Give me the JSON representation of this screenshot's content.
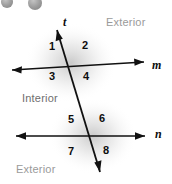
{
  "figure": {
    "type": "geometry-diagram",
    "background_color": "#ffffff",
    "shading_color": "#bdbdbd",
    "stroke_color": "#111111"
  },
  "lines": [
    {
      "id": "transversal",
      "label": "t",
      "label_x": 63,
      "label_y": 16,
      "x1": 57,
      "y1": 30,
      "x2": 100,
      "y2": 172,
      "arrow_start": true,
      "arrow_end": true
    },
    {
      "id": "line-m",
      "label": "m",
      "label_x": 152,
      "label_y": 59,
      "x1": 12,
      "y1": 70,
      "x2": 144,
      "y2": 62,
      "arrow_start": true,
      "arrow_end": true
    },
    {
      "id": "line-n",
      "label": "n",
      "label_x": 155,
      "label_y": 128,
      "x1": 16,
      "y1": 136,
      "x2": 145,
      "y2": 136,
      "arrow_start": true,
      "arrow_end": true
    }
  ],
  "intersections": [
    {
      "id": "upper-intersection",
      "x": 71,
      "y": 63
    },
    {
      "id": "lower-intersection",
      "x": 93,
      "y": 136
    }
  ],
  "angles": [
    {
      "number": "1",
      "x": 49,
      "y": 41
    },
    {
      "number": "2",
      "x": 82,
      "y": 40
    },
    {
      "number": "3",
      "x": 49,
      "y": 71
    },
    {
      "number": "4",
      "x": 83,
      "y": 71
    },
    {
      "number": "5",
      "x": 68,
      "y": 114
    },
    {
      "number": "6",
      "x": 99,
      "y": 113
    },
    {
      "number": "7",
      "x": 68,
      "y": 146
    },
    {
      "number": "8",
      "x": 103,
      "y": 145
    }
  ],
  "regions": [
    {
      "id": "exterior-top",
      "label": "Exterior",
      "x": 106,
      "y": 17,
      "style": "exterior"
    },
    {
      "id": "interior-middle",
      "label": "Interior",
      "x": 22,
      "y": 93,
      "style": "interior"
    },
    {
      "id": "exterior-bottom",
      "label": "Exterior",
      "x": 16,
      "y": 164,
      "style": "exterior"
    }
  ],
  "decorations": {
    "dots": [
      {
        "id": "dot-left",
        "cx": 7,
        "cy": 2,
        "r": 6,
        "color": "#9c9c9c"
      },
      {
        "id": "dot-right",
        "cx": 35,
        "cy": 3,
        "r": 7,
        "color": "#a3a3a3"
      }
    ]
  }
}
